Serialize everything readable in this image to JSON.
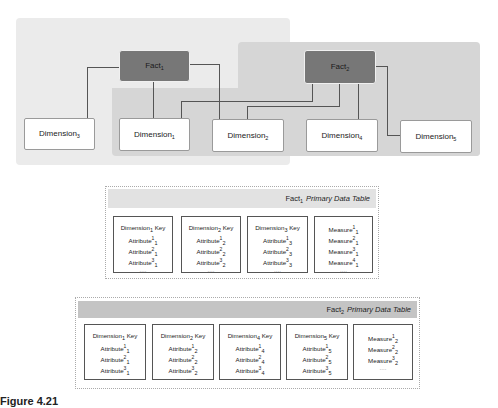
{
  "diagram": {
    "facts": [
      {
        "name": "Fact",
        "sub": "1"
      },
      {
        "name": "Fact",
        "sub": "2"
      }
    ],
    "dimensions": [
      {
        "name": "Dimension",
        "sub": "3"
      },
      {
        "name": "Dimension",
        "sub": "1"
      },
      {
        "name": "Dimension",
        "sub": "2"
      },
      {
        "name": "Dimension",
        "sub": "4"
      },
      {
        "name": "Dimension",
        "sub": "5"
      }
    ],
    "connections": [
      {
        "from": "Fact1",
        "to": "Dimension3"
      },
      {
        "from": "Fact1",
        "to": "Dimension1"
      },
      {
        "from": "Fact1",
        "to": "Dimension2"
      },
      {
        "from": "Fact2",
        "to": "Dimension1"
      },
      {
        "from": "Fact2",
        "to": "Dimension2"
      },
      {
        "from": "Fact2",
        "to": "Dimension4"
      },
      {
        "from": "Fact2",
        "to": "Dimension5"
      }
    ],
    "colors": {
      "fact_fill": "#777777",
      "left_region": "#ebebeb",
      "right_region": "#d6d6d6",
      "line": "#555555"
    }
  },
  "tables": [
    {
      "title_fact": "Fact",
      "title_sub": "1",
      "title_rest": "Primary Data Table",
      "cards": [
        {
          "key": "Dimension",
          "key_sub": "1",
          "key_suffix": " Key",
          "rows": [
            {
              "label": "Attribute",
              "sup": "1",
              "sub": "1"
            },
            {
              "label": "Attribute",
              "sup": "2",
              "sub": "1"
            },
            {
              "label": "Attribute",
              "sup": "3",
              "sub": "1"
            }
          ],
          "ellipsis": "...."
        },
        {
          "key": "Dimension",
          "key_sub": "2",
          "key_suffix": " Key",
          "rows": [
            {
              "label": "Attribute",
              "sup": "1",
              "sub": "2"
            },
            {
              "label": "Attribute",
              "sup": "2",
              "sub": "2"
            },
            {
              "label": "Attribute",
              "sup": "3",
              "sub": "2"
            }
          ],
          "ellipsis": "...."
        },
        {
          "key": "Dimension",
          "key_sub": "3",
          "key_suffix": " Key",
          "rows": [
            {
              "label": "Attribute",
              "sup": "1",
              "sub": "3"
            },
            {
              "label": "Attribute",
              "sup": "2",
              "sub": "3"
            },
            {
              "label": "Attribute",
              "sup": "3",
              "sub": "3"
            }
          ],
          "ellipsis": "...."
        },
        {
          "rows": [
            {
              "label": "Measure",
              "sup": "1",
              "sub": "1"
            },
            {
              "label": "Measure",
              "sup": "2",
              "sub": "1"
            },
            {
              "label": "Measure",
              "sup": "3",
              "sub": "1"
            },
            {
              "label": "Measure",
              "sup": "4",
              "sub": "1"
            }
          ],
          "ellipsis": "...."
        }
      ]
    },
    {
      "title_fact": "Fact",
      "title_sub": "2",
      "title_rest": "Primary Data Table",
      "cards": [
        {
          "key": "Dimension",
          "key_sub": "1",
          "key_suffix": " Key",
          "rows": [
            {
              "label": "Attribute",
              "sup": "1",
              "sub": "1"
            },
            {
              "label": "Attribute",
              "sup": "2",
              "sub": "1"
            },
            {
              "label": "Attribute",
              "sup": "3",
              "sub": "1"
            }
          ],
          "ellipsis": "...."
        },
        {
          "key": "Dimension",
          "key_sub": "2",
          "key_suffix": " Key",
          "rows": [
            {
              "label": "Attribute",
              "sup": "1",
              "sub": "2"
            },
            {
              "label": "Attribute",
              "sup": "2",
              "sub": "2"
            },
            {
              "label": "Attribute",
              "sup": "3",
              "sub": "2"
            }
          ],
          "ellipsis": "...."
        },
        {
          "key": "Dimension",
          "key_sub": "4",
          "key_suffix": " Key",
          "rows": [
            {
              "label": "Attribute",
              "sup": "1",
              "sub": "4"
            },
            {
              "label": "Attribute",
              "sup": "2",
              "sub": "4"
            },
            {
              "label": "Attribute",
              "sup": "3",
              "sub": "4"
            }
          ],
          "ellipsis": "...."
        },
        {
          "key": "Dimension",
          "key_sub": "5",
          "key_suffix": " Key",
          "rows": [
            {
              "label": "Attribute",
              "sup": "1",
              "sub": "5"
            },
            {
              "label": "Attribute",
              "sup": "2",
              "sub": "5"
            },
            {
              "label": "Attribute",
              "sup": "3",
              "sub": "5"
            }
          ],
          "ellipsis": "...."
        },
        {
          "rows": [
            {
              "label": "Measure",
              "sup": "1",
              "sub": "2"
            },
            {
              "label": "Measure",
              "sup": "2",
              "sub": "2"
            },
            {
              "label": "Measure",
              "sup": "3",
              "sub": "2"
            }
          ],
          "ellipsis": "...."
        }
      ]
    }
  ],
  "caption": {
    "label": "Figure 4.21",
    "text": ""
  }
}
